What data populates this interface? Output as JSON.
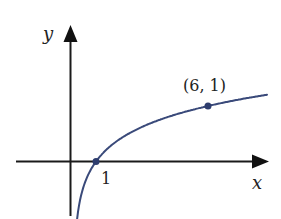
{
  "diagram": {
    "type": "function-graph",
    "function": "logarithmic curve through (1, 0) and (6, 1)",
    "axes": {
      "x_label": "x",
      "y_label": "y"
    },
    "tick_labels": {
      "x_intercept": "1"
    },
    "points": [
      {
        "label": "",
        "x": 1,
        "y": 0
      },
      {
        "label": "(6, 1)",
        "x": 6,
        "y": 1
      }
    ],
    "colors": {
      "curve": "#3a4a7a",
      "axis": "#1a1a1a",
      "point": "#2e3d6e"
    }
  }
}
